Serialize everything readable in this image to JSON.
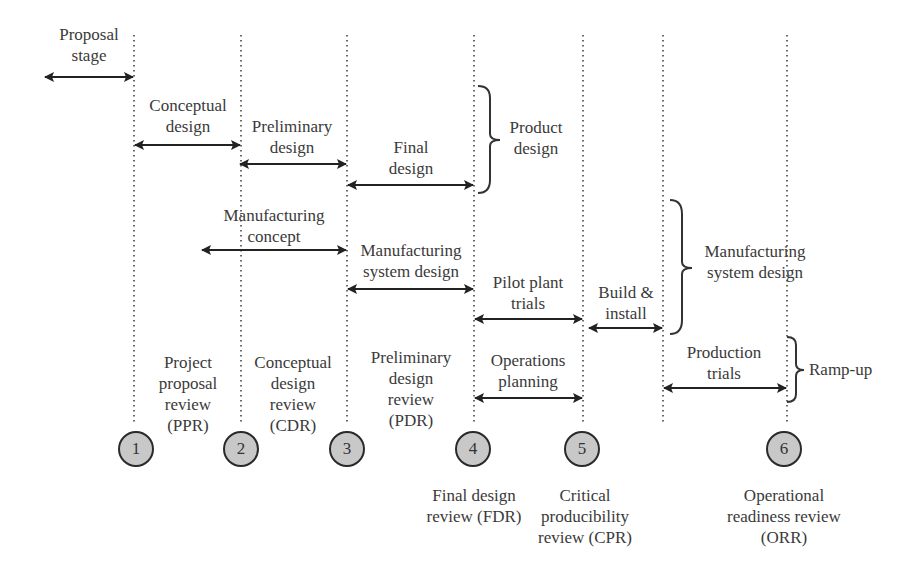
{
  "diagram": {
    "phases": {
      "proposal_stage": "Proposal\nstage",
      "conceptual_design": "Conceptual\ndesign",
      "preliminary_design": "Preliminary\ndesign",
      "final_design": "Final\ndesign",
      "product_design": "Product\ndesign",
      "manufacturing_concept": "Manufacturing\nconcept",
      "manufacturing_system_design": "Manufacturing\nsystem design",
      "pilot_plant_trials": "Pilot plant\ntrials",
      "build_install": "Build &\ninstall",
      "manufacturing_system_design_group": "Manufacturing\nsystem design",
      "operations_planning": "Operations\nplanning",
      "production_trials": "Production\ntrials",
      "ramp_up": "Ramp-up"
    },
    "reviews": [
      {
        "num": "1",
        "label": "Project\nproposal\nreview\n(PPR)"
      },
      {
        "num": "2",
        "label": "Conceptual\ndesign\nreview\n(CDR)"
      },
      {
        "num": "3",
        "label": "Preliminary\ndesign\nreview\n(PDR)"
      },
      {
        "num": "4",
        "label": "Final design\nreview (FDR)"
      },
      {
        "num": "5",
        "label": "Critical\nproducibility\nreview (CPR)"
      },
      {
        "num": "6",
        "label": "Operational\nreadiness review\n(ORR)"
      }
    ]
  }
}
